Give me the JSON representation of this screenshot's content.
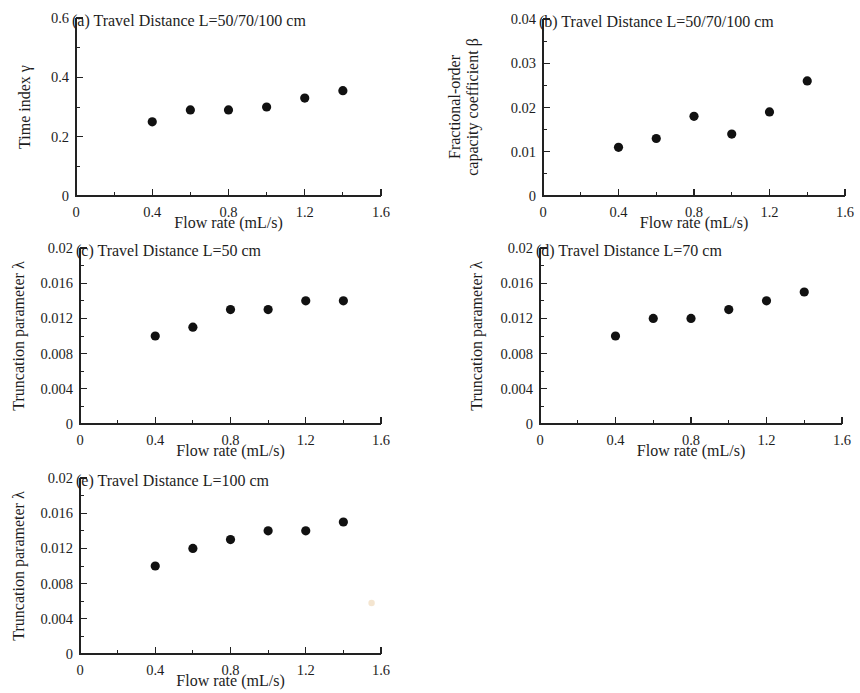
{
  "figure": {
    "background": "#ffffff",
    "marker_color": "#111111",
    "axis_color": "#222222",
    "width": 860,
    "height": 693
  },
  "common": {
    "xlabel": "Flow rate (mL/s)",
    "x_ticks": [
      "0",
      "0.4",
      "0.8",
      "1.2",
      "1.6"
    ],
    "x_tick_values": [
      0,
      0.4,
      0.8,
      1.2,
      1.6
    ],
    "xlim": [
      0,
      1.6
    ],
    "x_minor_per_major": 2
  },
  "panels": [
    {
      "key": "a",
      "title": "(a) Travel Distance L=50/70/100 cm",
      "ylabel": "Time index γ",
      "y_ticks": [
        "0",
        "0.2",
        "0.4",
        "0.6"
      ],
      "y_tick_values": [
        0,
        0.2,
        0.4,
        0.6
      ],
      "ylim": [
        0,
        0.6
      ],
      "y_minor_per_major": 2
    },
    {
      "key": "b",
      "title": "(b) Travel Distance L=50/70/100 cm",
      "ylabel": "Fractional-order\ncapacity coefficient β",
      "ylabel_line1": "Fractional-order",
      "ylabel_line2": "capacity coefficient β",
      "y_ticks": [
        "0",
        "0.01",
        "0.02",
        "0.03",
        "0.04"
      ],
      "y_tick_values": [
        0,
        0.01,
        0.02,
        0.03,
        0.04
      ],
      "ylim": [
        0,
        0.04
      ],
      "y_minor_per_major": 2
    },
    {
      "key": "c",
      "title": "(c) Travel Distance L=50 cm",
      "ylabel": "Truncation parameter λ",
      "y_ticks": [
        "0",
        "0.004",
        "0.008",
        "0.012",
        "0.016",
        "0.02"
      ],
      "y_tick_values": [
        0,
        0.004,
        0.008,
        0.012,
        0.016,
        0.02
      ],
      "ylim": [
        0,
        0.02
      ],
      "y_minor_per_major": 2
    },
    {
      "key": "d",
      "title": "(d) Travel Distance L=70 cm",
      "ylabel": "Truncation parameter λ",
      "y_ticks": [
        "0",
        "0.004",
        "0.008",
        "0.012",
        "0.016",
        "0.02"
      ],
      "y_tick_values": [
        0,
        0.004,
        0.008,
        0.012,
        0.016,
        0.02
      ],
      "ylim": [
        0,
        0.02
      ],
      "y_minor_per_major": 2
    },
    {
      "key": "e",
      "title": "(e) Travel Distance L=100 cm",
      "ylabel": "Truncation parameter λ",
      "y_ticks": [
        "0",
        "0.004",
        "0.008",
        "0.012",
        "0.016",
        "0.02"
      ],
      "y_tick_values": [
        0,
        0.004,
        0.008,
        0.012,
        0.016,
        0.02
      ],
      "ylim": [
        0,
        0.02
      ],
      "y_minor_per_major": 2
    }
  ],
  "chart_data": [
    {
      "panel": "a",
      "type": "scatter",
      "title": "(a) Travel Distance L=50/70/100 cm",
      "xlabel": "Flow rate (mL/s)",
      "ylabel": "Time index γ",
      "xlim": [
        0,
        1.6
      ],
      "ylim": [
        0,
        0.6
      ],
      "grid": false,
      "legend": null,
      "x": [
        0.4,
        0.6,
        0.8,
        1.0,
        1.2,
        1.4
      ],
      "y": [
        0.25,
        0.29,
        0.29,
        0.3,
        0.33,
        0.355
      ]
    },
    {
      "panel": "b",
      "type": "scatter",
      "title": "(b) Travel Distance L=50/70/100 cm",
      "xlabel": "Flow rate (mL/s)",
      "ylabel": "Fractional-order capacity coefficient β",
      "xlim": [
        0,
        1.6
      ],
      "ylim": [
        0,
        0.04
      ],
      "grid": false,
      "legend": null,
      "x": [
        0.4,
        0.6,
        0.8,
        1.0,
        1.2,
        1.4
      ],
      "y": [
        0.011,
        0.013,
        0.018,
        0.014,
        0.019,
        0.026
      ]
    },
    {
      "panel": "c",
      "type": "scatter",
      "title": "(c) Travel Distance L=50 cm",
      "xlabel": "Flow rate (mL/s)",
      "ylabel": "Truncation parameter λ",
      "xlim": [
        0,
        1.6
      ],
      "ylim": [
        0,
        0.02
      ],
      "grid": false,
      "legend": null,
      "x": [
        0.4,
        0.6,
        0.8,
        1.0,
        1.2,
        1.4
      ],
      "y": [
        0.01,
        0.011,
        0.013,
        0.013,
        0.014,
        0.014
      ]
    },
    {
      "panel": "d",
      "type": "scatter",
      "title": "(d) Travel Distance L=70 cm",
      "xlabel": "Flow rate (mL/s)",
      "ylabel": "Truncation parameter λ",
      "xlim": [
        0,
        1.6
      ],
      "ylim": [
        0,
        0.02
      ],
      "grid": false,
      "legend": null,
      "x": [
        0.4,
        0.6,
        0.8,
        1.0,
        1.2,
        1.4
      ],
      "y": [
        0.01,
        0.012,
        0.012,
        0.013,
        0.014,
        0.015
      ]
    },
    {
      "panel": "e",
      "type": "scatter",
      "title": "(e) Travel Distance L=100 cm",
      "xlabel": "Flow rate (mL/s)",
      "ylabel": "Truncation parameter λ",
      "xlim": [
        0,
        1.6
      ],
      "ylim": [
        0,
        0.02
      ],
      "grid": false,
      "legend": null,
      "x": [
        0.4,
        0.6,
        0.8,
        1.0,
        1.2,
        1.4
      ],
      "y": [
        0.01,
        0.012,
        0.013,
        0.014,
        0.014,
        0.015
      ]
    }
  ]
}
